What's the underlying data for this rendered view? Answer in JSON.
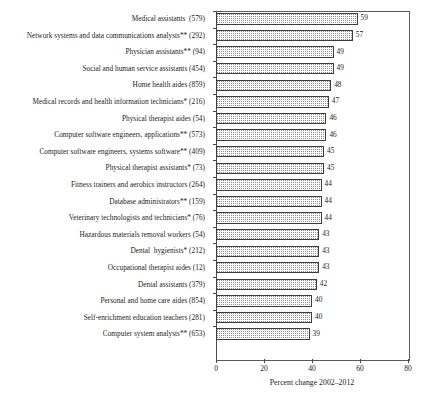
{
  "chart_data": {
    "type": "bar",
    "orientation": "horizontal",
    "title": "",
    "xlabel": "Percent change 2002–2012",
    "ylabel": "",
    "xlim": [
      0,
      80
    ],
    "xticks": [
      0,
      20,
      40,
      60,
      80
    ],
    "xtick_labels": [
      "0",
      "20",
      "40",
      "60",
      "80"
    ],
    "grid": false,
    "legend": null,
    "categories": [
      "Medical assistants  (579)",
      "Network systems and data communications analysts** (292)",
      "Physician assistants** (94)",
      "Social and human service assistants (454)",
      "Home health aides (859)",
      "Medical records and health information technicians* (216)",
      "Physical therapist aides (54)",
      "Computer software engineers, applications** (573)",
      "Computer software engineers, systems software** (409)",
      "Physical therapist assistants* (73)",
      "Fitness trainers and aerobics instructors (264)",
      "Database administrators** (159)",
      "Veterinary technologists and technicians* (76)",
      "Hazardous materials removal workers (54)",
      "Dental  hygienists* (212)",
      "Occupational therapist aides (12)",
      "Dental assistants (379)",
      "Personal and home care aides (854)",
      "Self-enrichment education teachers (281)",
      "Computer system analysts** (653)"
    ],
    "values": [
      59,
      57,
      49,
      49,
      48,
      47,
      46,
      46,
      45,
      45,
      44,
      44,
      44,
      43,
      43,
      43,
      42,
      40,
      40,
      39
    ],
    "value_labels": [
      "59",
      "57",
      "49",
      "49",
      "48",
      "47",
      "46",
      "46",
      "45",
      "45",
      "44",
      "44",
      "44",
      "43",
      "43",
      "43",
      "42",
      "40",
      "40",
      "39"
    ],
    "colors": {
      "bar_fill": "#fbfbfb",
      "bar_pattern": "#8e8e8e",
      "bar_border": "#3c3c3c",
      "axis": "#4a4a4a",
      "text": "#1c1c1c",
      "background": "#ffffff"
    }
  }
}
